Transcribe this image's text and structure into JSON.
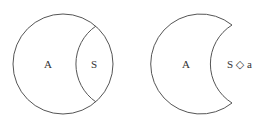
{
  "diagram": {
    "left": {
      "label_a": "A",
      "label_s": "S"
    },
    "right": {
      "label_a": "A",
      "label_s": "S ◇ a"
    }
  },
  "colors": {
    "stroke": "#555555",
    "text": "#333333"
  }
}
